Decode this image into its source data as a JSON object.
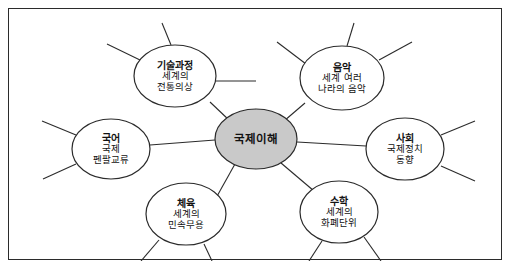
{
  "diagram": {
    "type": "mind-map",
    "center": {
      "title": "국제이해",
      "cx": 247,
      "cy": 130,
      "rx": 41,
      "ry": 30,
      "fill": "#c9c9c9",
      "stroke": "#2b2b2b"
    },
    "node_fill": "#ffffff",
    "node_stroke": "#2b2b2b",
    "border_color": "#2b2b2b",
    "background": "#ffffff",
    "nodes": [
      {
        "id": "node-technology",
        "title": "기술과정",
        "lines": [
          "세계의",
          "전통의상"
        ],
        "cx": 166,
        "cy": 67,
        "rx": 41,
        "ry": 31,
        "spokes": [
          {
            "x1": 131,
            "y1": 51,
            "x2": 98,
            "y2": 35
          },
          {
            "x1": 162,
            "y1": 36,
            "x2": 153,
            "y2": 14
          },
          {
            "x1": 207,
            "y1": 72,
            "x2": 247,
            "y2": 72
          }
        ]
      },
      {
        "id": "node-music",
        "title": "음악",
        "lines": [
          "세계 여러",
          "나라의 음악"
        ],
        "cx": 333,
        "cy": 69,
        "rx": 42,
        "ry": 32,
        "spokes": [
          {
            "x1": 370,
            "y1": 51,
            "x2": 403,
            "y2": 33
          },
          {
            "x1": 338,
            "y1": 37,
            "x2": 345,
            "y2": 14
          },
          {
            "x1": 297,
            "y1": 55,
            "x2": 268,
            "y2": 33
          }
        ]
      },
      {
        "id": "node-korean",
        "title": "국어",
        "lines": [
          "국제",
          "펜팔교류"
        ],
        "cx": 102,
        "cy": 140,
        "rx": 39,
        "ry": 30,
        "spokes": [
          {
            "x1": 67,
            "y1": 126,
            "x2": 33,
            "y2": 112
          },
          {
            "x1": 67,
            "y1": 155,
            "x2": 34,
            "y2": 170
          }
        ]
      },
      {
        "id": "node-society",
        "title": "사회",
        "lines": [
          "국제정치",
          "동향"
        ],
        "cx": 396,
        "cy": 140,
        "rx": 39,
        "ry": 31,
        "spokes": [
          {
            "x1": 432,
            "y1": 126,
            "x2": 466,
            "y2": 112
          },
          {
            "x1": 432,
            "y1": 157,
            "x2": 466,
            "y2": 172
          }
        ]
      },
      {
        "id": "node-physical-education",
        "title": "체육",
        "lines": [
          "세계의",
          "민속무용"
        ],
        "cx": 177,
        "cy": 205,
        "rx": 40,
        "ry": 31,
        "spokes": [
          {
            "x1": 150,
            "y1": 231,
            "x2": 132,
            "y2": 252
          },
          {
            "x1": 195,
            "y1": 235,
            "x2": 203,
            "y2": 252
          }
        ]
      },
      {
        "id": "node-mathematics",
        "title": "수학",
        "lines": [
          "세계의",
          "화폐단위"
        ],
        "cx": 330,
        "cy": 203,
        "rx": 39,
        "ry": 31,
        "spokes": [
          {
            "x1": 313,
            "y1": 232,
            "x2": 300,
            "y2": 252
          },
          {
            "x1": 355,
            "y1": 228,
            "x2": 372,
            "y2": 252
          }
        ]
      }
    ],
    "connectors": [
      {
        "from": "node-technology",
        "x1": 201,
        "y1": 93,
        "x2": 221,
        "y2": 112
      },
      {
        "from": "node-music",
        "x1": 296,
        "y1": 94,
        "x2": 275,
        "y2": 112
      },
      {
        "from": "node-korean",
        "x1": 141,
        "y1": 136,
        "x2": 206,
        "y2": 131
      },
      {
        "from": "node-society",
        "x1": 357,
        "y1": 137,
        "x2": 288,
        "y2": 133
      },
      {
        "from": "node-physical-education",
        "x1": 207,
        "y1": 189,
        "x2": 226,
        "y2": 155
      },
      {
        "from": "node-mathematics",
        "x1": 305,
        "y1": 182,
        "x2": 272,
        "y2": 154
      }
    ]
  }
}
